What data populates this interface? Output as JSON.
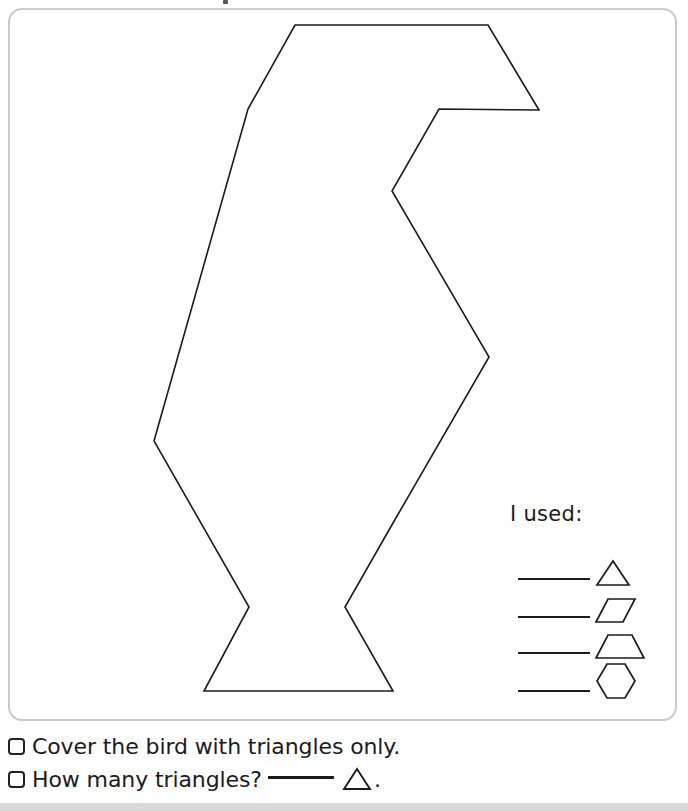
{
  "page": {
    "background_color": "#ffffff",
    "ink_color": "#1b1b1b",
    "card_border_color": "#c9cacc"
  },
  "worksheet": {
    "name": "bird-pattern-block-worksheet",
    "figure": {
      "name": "bird-outline",
      "description": "bird outline made of pattern-block shapes",
      "stroke_color": "#1b1b1b",
      "stroke_width": 1.6,
      "fill": "none",
      "vertices": [
        [
          293,
          23
        ],
        [
          486,
          23
        ],
        [
          537,
          108
        ],
        [
          437,
          107
        ],
        [
          390,
          189
        ],
        [
          487,
          355
        ],
        [
          391,
          521
        ],
        [
          343,
          605
        ],
        [
          391,
          689
        ],
        [
          202,
          689
        ],
        [
          247,
          605
        ],
        [
          152,
          439
        ],
        [
          246,
          107
        ]
      ]
    }
  },
  "legend": {
    "title": "I used:",
    "rows": [
      {
        "blank_label": "",
        "shape": "triangle",
        "shape_name": "triangle-shape"
      },
      {
        "blank_label": "",
        "shape": "rhombus",
        "shape_name": "rhombus-shape"
      },
      {
        "blank_label": "",
        "shape": "trapezoid",
        "shape_name": "trapezoid-shape"
      },
      {
        "blank_label": "",
        "shape": "hexagon",
        "shape_name": "hexagon-shape"
      }
    ]
  },
  "checklist": {
    "items": [
      {
        "checked": false,
        "text": "Cover the bird with triangles only.",
        "has_answer_blank": false,
        "has_triangle": false,
        "answer_value": ""
      },
      {
        "checked": false,
        "text_before": "How many triangles?",
        "text_after": ".",
        "has_answer_blank": true,
        "has_triangle": true,
        "answer_value": ""
      }
    ]
  }
}
